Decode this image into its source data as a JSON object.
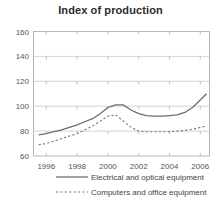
{
  "chart_data": {
    "type": "line",
    "title": "Index of production",
    "xlabel": "",
    "ylabel": "",
    "xlim": [
      1995.2,
      2006.6
    ],
    "ylim": [
      60,
      160
    ],
    "grid": true,
    "legend_position": "bottom",
    "x_tick_labels": [
      "1996",
      "1998",
      "2000",
      "2002",
      "2004",
      "2006"
    ],
    "x_tick_values": [
      1996,
      1998,
      2000,
      2002,
      2004,
      2006
    ],
    "y_tick_labels": [
      "60",
      "80",
      "100",
      "120",
      "140",
      "160"
    ],
    "y_tick_values": [
      60,
      80,
      100,
      120,
      140,
      160
    ],
    "x": [
      1995.5,
      1996,
      1996.5,
      1997,
      1997.5,
      1998,
      1998.5,
      1999,
      1999.5,
      2000,
      2000.5,
      2001,
      2001.5,
      2002,
      2002.5,
      2003,
      2003.5,
      2004,
      2004.5,
      2005,
      2005.5,
      2006,
      2006.4
    ],
    "series": [
      {
        "name": "Electrical and optical equipment",
        "style": "solid",
        "color": "#6b6b6b",
        "values": [
          77,
          78,
          79.5,
          81,
          83,
          85,
          87.5,
          90,
          94,
          99,
          101,
          101,
          97,
          94,
          92.5,
          92,
          92,
          92.5,
          93,
          95,
          99,
          105,
          110
        ]
      },
      {
        "name": "Computers and office equipment",
        "style": "dashed",
        "color": "#7a7a7a",
        "values": [
          69,
          70,
          72,
          74,
          76,
          78,
          81,
          84,
          88,
          92,
          93,
          88,
          83,
          80,
          79.5,
          79.5,
          79.5,
          79.5,
          80,
          80.5,
          81.5,
          83,
          84
        ]
      }
    ]
  },
  "legend": {
    "entries": [
      {
        "label": "Electrical and optical equipment",
        "style": "solid"
      },
      {
        "label": "Computers and office equipment",
        "style": "dashed"
      }
    ]
  }
}
